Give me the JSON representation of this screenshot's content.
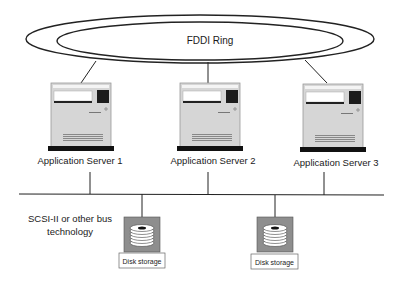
{
  "ring": {
    "label": "FDDI Ring"
  },
  "servers": [
    {
      "label": "Application Server 1"
    },
    {
      "label": "Application Server 2"
    },
    {
      "label": "Application Server 3"
    }
  ],
  "bus": {
    "label_line1": "SCSI-II or other bus",
    "label_line2": "technology"
  },
  "storage": [
    {
      "label": "Disk storage"
    },
    {
      "label": "Disk storage"
    }
  ],
  "colors": {
    "line": "#222222",
    "server_body": "#d4d4d4",
    "server_base": "#111111",
    "disk_box": "#8c8c8c"
  }
}
